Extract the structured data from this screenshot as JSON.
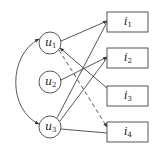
{
  "diagram": {
    "type": "bipartite-graph",
    "users": [
      {
        "id": "u1",
        "label": "u",
        "sub": "1",
        "cx": 50,
        "cy": 43
      },
      {
        "id": "u2",
        "label": "u",
        "sub": "2",
        "cx": 50,
        "cy": 82
      },
      {
        "id": "u3",
        "label": "u",
        "sub": "3",
        "cx": 50,
        "cy": 127
      }
    ],
    "items": [
      {
        "id": "i1",
        "label": "i",
        "sub": "1",
        "x": 107,
        "y": 12
      },
      {
        "id": "i2",
        "label": "i",
        "sub": "2",
        "x": 107,
        "y": 48
      },
      {
        "id": "i3",
        "label": "i",
        "sub": "3",
        "x": 107,
        "y": 86
      },
      {
        "id": "i4",
        "label": "i",
        "sub": "4",
        "x": 107,
        "y": 122
      }
    ],
    "edges": [
      {
        "from": "u1",
        "to": "i1",
        "style": "solid"
      },
      {
        "from": "i3",
        "to": "u1",
        "style": "solid"
      },
      {
        "from": "u1",
        "to": "i4",
        "style": "dashed"
      },
      {
        "from": "u2",
        "to": "i2",
        "style": "solid"
      },
      {
        "from": "u3",
        "to": "i1",
        "style": "solid"
      },
      {
        "from": "u3",
        "to": "i2",
        "style": "solid"
      },
      {
        "from": "u3",
        "to": "i4",
        "style": "solid"
      },
      {
        "from": "u1",
        "to": "u3",
        "style": "curved-bidirectional"
      }
    ],
    "colors": {
      "stroke": "#444444",
      "background": "#ffffff"
    }
  }
}
